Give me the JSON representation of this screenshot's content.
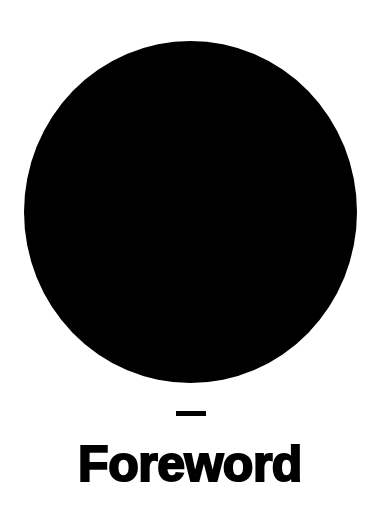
{
  "page": {
    "kind": "book-section-opener",
    "background_color": "#ffffff",
    "ink_color": "#000000"
  },
  "ornament": {
    "circle_name": "filled-circle-mark",
    "circle_color": "#000000",
    "rule_name": "short-horizontal-rule",
    "rule_color": "#000000"
  },
  "heading": {
    "title": "Foreword"
  }
}
